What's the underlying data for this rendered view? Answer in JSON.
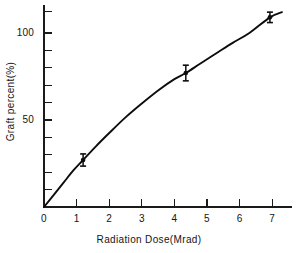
{
  "chart_data": {
    "type": "line",
    "title": "",
    "xlabel": "Radiation Dose(Mrad)",
    "ylabel": "Graft percent(%)",
    "xlim": [
      0,
      7.8
    ],
    "ylim": [
      0,
      116
    ],
    "grid": false,
    "legend": "none",
    "x_ticks": [
      0,
      1,
      2,
      3,
      4,
      5,
      6,
      7
    ],
    "x_tick_labels": [
      "0",
      "1",
      "2",
      "3",
      "4",
      "5",
      "6",
      "7"
    ],
    "y_ticks": [
      0,
      10,
      20,
      30,
      40,
      50,
      60,
      70,
      80,
      90,
      100,
      110
    ],
    "y_tick_labels_shown": [
      "50",
      "100"
    ],
    "y_labeled_ticks": [
      50,
      100
    ],
    "series": [
      {
        "name": "fitted curve",
        "style": "smooth-line",
        "x": [
          0.0,
          0.3,
          0.6,
          0.9,
          1.2,
          1.6,
          2.0,
          2.5,
          3.0,
          3.5,
          4.0,
          4.35,
          4.8,
          5.3,
          5.8,
          6.3,
          6.93,
          7.3
        ],
        "y": [
          0.0,
          7.0,
          14.0,
          21.0,
          27.0,
          35.0,
          42.5,
          51.5,
          59.5,
          67.0,
          73.5,
          77.0,
          82.5,
          88.5,
          94.5,
          100.0,
          109.0,
          112.0
        ]
      },
      {
        "name": "measured points",
        "style": "markers-with-error-bars",
        "points": [
          {
            "x": 1.2,
            "y": 27.0,
            "yerr": 3.5
          },
          {
            "x": 4.35,
            "y": 77.0,
            "yerr": 4.5
          },
          {
            "x": 6.93,
            "y": 109.0,
            "yerr": 3.0
          }
        ]
      }
    ]
  },
  "figure": {
    "background_color": "#ffffff",
    "ink_color": "#0d0d0d"
  }
}
